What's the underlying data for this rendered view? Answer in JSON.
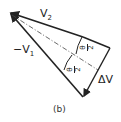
{
  "diagram": {
    "labels": {
      "v2": {
        "main": "V",
        "sub": "2"
      },
      "neg_v1": {
        "main": "−V",
        "sub": "1"
      },
      "theta_half_upper": {
        "num": "θ",
        "den": "2"
      },
      "theta_half_lower": {
        "num": "θ",
        "den": "2"
      },
      "delta_v": "ΔV"
    },
    "caption": "(b)",
    "colors": {
      "stroke": "#222222",
      "background": "#ffffff"
    }
  }
}
